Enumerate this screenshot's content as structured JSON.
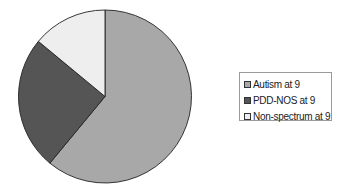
{
  "chart_data": {
    "type": "pie",
    "title": "",
    "categories": [
      "Autism at 9",
      "PDD-NOS at 9",
      "Non-spectrum at 9"
    ],
    "values": [
      61,
      25,
      14
    ],
    "colors": [
      "#a8a8a8",
      "#555555",
      "#eeeeee"
    ],
    "start_angle_deg": 0,
    "direction": "clockwise",
    "legend_position": "right",
    "xlabel": "",
    "ylabel": ""
  },
  "legend": {
    "items": [
      {
        "label": "Autism at 9",
        "color": "#a8a8a8"
      },
      {
        "label": "PDD-NOS at 9",
        "color": "#555555"
      },
      {
        "label": "Non-spectrum at 9",
        "color": "#eeeeee"
      }
    ]
  }
}
